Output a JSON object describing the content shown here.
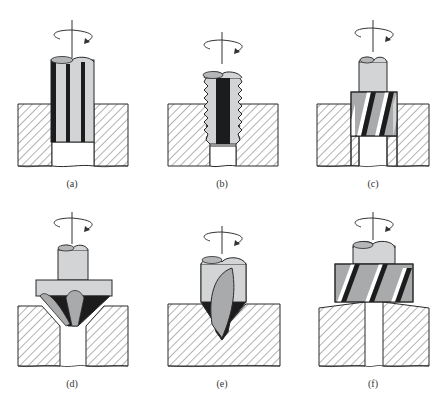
{
  "figure": {
    "panels": [
      {
        "label": "(a)",
        "tool": "straight-flute-reamer",
        "through_hole": false
      },
      {
        "label": "(b)",
        "tool": "tap",
        "through_hole": false
      },
      {
        "label": "(c)",
        "tool": "counterbore",
        "through_hole": false
      },
      {
        "label": "(d)",
        "tool": "countersink",
        "through_hole": true
      },
      {
        "label": "(e)",
        "tool": "center-drill",
        "through_hole": false
      },
      {
        "label": "(f)",
        "tool": "spot-face",
        "through_hole": true
      }
    ]
  },
  "colors": {
    "tool_light": "#d2d4d6",
    "tool_mid": "#a8aaac",
    "tool_dark": "#1c1c1c",
    "outline": "#2a2a2a",
    "hatch": "#555555",
    "background": "#ffffff"
  }
}
